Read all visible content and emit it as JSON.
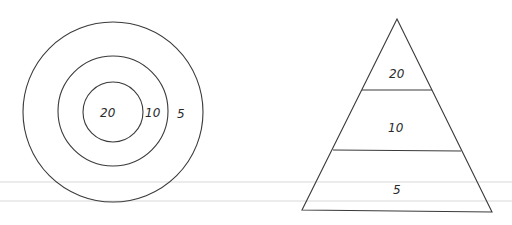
{
  "target": {
    "rings": [
      {
        "label": "20",
        "radius": 30
      },
      {
        "label": "10",
        "radius": 55
      },
      {
        "label": "5",
        "radius": 90
      }
    ],
    "center": {
      "x": 113,
      "y": 112
    }
  },
  "pyramid": {
    "tiers": [
      {
        "label": "20"
      },
      {
        "label": "10"
      },
      {
        "label": "5"
      }
    ]
  },
  "colors": {
    "line": "#3a3a3a",
    "background": "#ffffff"
  }
}
